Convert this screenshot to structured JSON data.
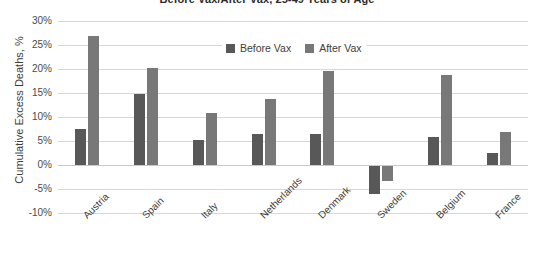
{
  "chart_data": {
    "type": "bar",
    "title": "Before Vax/After Vax, 25-49 Years of Age",
    "xlabel": "",
    "ylabel": "Cumulative Excess Deaths, %",
    "ylim": [
      -10,
      30
    ],
    "ytick_step": 5,
    "ytick_labels": [
      "30%",
      "25%",
      "20%",
      "15%",
      "10%",
      "5%",
      "0%",
      "-5%",
      "-10%"
    ],
    "ytick_values": [
      30,
      25,
      20,
      15,
      10,
      5,
      0,
      -5,
      -10
    ],
    "grid": true,
    "legend_position": "top-center",
    "categories": [
      "Austria",
      "Spain",
      "Italy",
      "Netherlands",
      "Denmark",
      "Sweden",
      "Belgium",
      "France"
    ],
    "series": [
      {
        "name": "Before Vax",
        "color": "#585858",
        "values": [
          7.5,
          14.8,
          5.3,
          6.4,
          6.5,
          -6.0,
          5.9,
          2.6
        ]
      },
      {
        "name": "After Vax",
        "color": "#787878",
        "values": [
          26.8,
          20.2,
          10.8,
          13.8,
          19.5,
          -3.3,
          18.8,
          6.9
        ]
      }
    ]
  },
  "legend": {
    "entries": [
      {
        "label": "Before Vax"
      },
      {
        "label": "After Vax"
      }
    ]
  }
}
